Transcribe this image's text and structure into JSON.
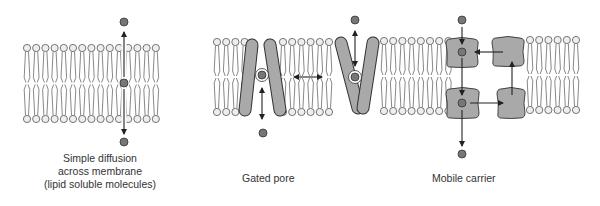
{
  "colors": {
    "background": "#ffffff",
    "lipid_head_fill": "#eeeeee",
    "lipid_stroke": "#555555",
    "protein_fill": "#a9a9a9",
    "protein_stroke": "#333333",
    "molecule_fill": "#777777",
    "molecule_stroke": "#333333",
    "arrow": "#222222",
    "text": "#333333"
  },
  "panels": [
    {
      "id": "simple-diffusion",
      "label_lines": [
        "Simple diffusion",
        "across membrane",
        "(lipid soluble molecules)"
      ],
      "label_x": 100,
      "label_y": 152
    },
    {
      "id": "gated-pore",
      "label_lines": [
        "Gated pore"
      ],
      "label_x": 242,
      "label_y": 172
    },
    {
      "id": "mobile-carrier",
      "label_lines": [
        "Mobile carrier"
      ],
      "label_x": 494,
      "label_y": 172
    }
  ],
  "membranes": [
    {
      "name": "membrane-simple-diffusion",
      "x_start": 27,
      "count": 15,
      "spacing": 9.2,
      "top_y": 48,
      "bottom_y": 119,
      "skip": []
    },
    {
      "name": "membrane-gated-pore-left",
      "x_start": 217,
      "count": 4,
      "spacing": 9.2,
      "top_y": 42,
      "bottom_y": 112,
      "skip": []
    },
    {
      "name": "membrane-gated-pore-middle",
      "x_start": 283,
      "count": 6,
      "spacing": 9.2,
      "top_y": 42,
      "bottom_y": 112,
      "skip": []
    },
    {
      "name": "membrane-gated-pore-right",
      "x_start": 384,
      "count": 8,
      "spacing": 9.2,
      "top_y": 41,
      "bottom_y": 111,
      "skip": []
    },
    {
      "name": "membrane-mobile-carrier-right",
      "x_start": 530,
      "count": 6,
      "spacing": 9.2,
      "top_y": 40,
      "bottom_y": 110,
      "skip": []
    }
  ],
  "diffusion": {
    "x": 124,
    "molecules": [
      {
        "cx": 124,
        "cy": 22
      },
      {
        "cx": 124,
        "cy": 83
      },
      {
        "cx": 124,
        "cy": 142
      }
    ],
    "arrows": [
      {
        "x1": 124,
        "y1": 77,
        "x2": 124,
        "y2": 32
      },
      {
        "x1": 124,
        "y1": 89,
        "x2": 124,
        "y2": 134
      }
    ]
  },
  "gated_pore": {
    "closed_pore": {
      "left_rod": {
        "x1": 252,
        "y1": 45,
        "x2": 245,
        "y2": 110
      },
      "right_rod": {
        "x1": 270,
        "y1": 45,
        "x2": 280,
        "y2": 110
      }
    },
    "open_pore": {
      "left_rod": {
        "x1": 341,
        "y1": 43,
        "x2": 358,
        "y2": 108
      },
      "right_rod": {
        "x1": 373,
        "y1": 43,
        "x2": 363,
        "y2": 108
      }
    },
    "molecules": [
      {
        "cx": 262,
        "cy": 75,
        "halo": true
      },
      {
        "cx": 263,
        "cy": 133,
        "halo": false
      },
      {
        "cx": 355,
        "cy": 20,
        "halo": false
      },
      {
        "cx": 355,
        "cy": 77,
        "halo": true
      }
    ],
    "arrows": [
      {
        "x1": 262,
        "y1": 88,
        "x2": 262,
        "y2": 119,
        "double": true
      },
      {
        "x1": 294,
        "y1": 77,
        "x2": 322,
        "y2": 77,
        "double": true
      },
      {
        "x1": 355,
        "y1": 31,
        "x2": 355,
        "y2": 66,
        "double": true
      }
    ]
  },
  "mobile_carrier": {
    "carriers": [
      {
        "name": "carrier-top-left",
        "x": 446,
        "y": 38,
        "w": 32,
        "h": 29
      },
      {
        "name": "carrier-top-right",
        "x": 492,
        "y": 37,
        "w": 32,
        "h": 29
      },
      {
        "name": "carrier-bottom-left",
        "x": 446,
        "y": 88,
        "w": 33,
        "h": 30
      },
      {
        "name": "carrier-bottom-right",
        "x": 497,
        "y": 88,
        "w": 28,
        "h": 30
      }
    ],
    "molecules": [
      {
        "cx": 462,
        "cy": 20
      },
      {
        "cx": 462,
        "cy": 52
      },
      {
        "cx": 462,
        "cy": 103
      },
      {
        "cx": 462,
        "cy": 154
      }
    ],
    "arrows": [
      {
        "x1": 462,
        "y1": 27,
        "x2": 462,
        "y2": 44
      },
      {
        "x1": 462,
        "y1": 58,
        "x2": 462,
        "y2": 95
      },
      {
        "x1": 462,
        "y1": 110,
        "x2": 462,
        "y2": 146
      },
      {
        "x1": 470,
        "y1": 103,
        "x2": 503,
        "y2": 103
      },
      {
        "x1": 512,
        "y1": 95,
        "x2": 512,
        "y2": 62
      },
      {
        "x1": 503,
        "y1": 52,
        "x2": 475,
        "y2": 52
      }
    ]
  }
}
